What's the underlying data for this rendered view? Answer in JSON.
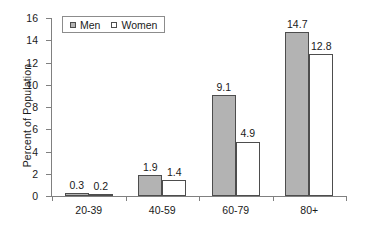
{
  "chart_data": {
    "type": "bar",
    "title": "",
    "xlabel": "",
    "ylabel": "Percent of Population",
    "categories": [
      "20-39",
      "40-59",
      "60-79",
      "80+"
    ],
    "series": [
      {
        "name": "Men",
        "swatch": "filled-gray-square",
        "color": "#b3b3b3",
        "values": [
          0.3,
          0.2999999,
          9.1,
          14.7
        ]
      },
      {
        "name": "Women",
        "swatch": "open-white-square",
        "color": "#ffffff",
        "values": [
          0.2,
          1.4,
          4.9,
          12.8
        ]
      }
    ],
    "series_corrected": [
      {
        "name": "Men",
        "values": [
          0.3,
          1.9,
          9.1,
          14.7
        ]
      },
      {
        "name": "Women",
        "values": [
          0.2,
          1.4,
          4.9,
          12.8
        ]
      }
    ],
    "data_labels": [
      [
        "0.3",
        "0.2"
      ],
      [
        "1.9",
        "1.4"
      ],
      [
        "9.1",
        "4.9"
      ],
      [
        "14.7",
        "12.8"
      ]
    ],
    "ylim": [
      0,
      16
    ],
    "yticks": [
      0,
      2,
      4,
      6,
      8,
      10,
      12,
      14,
      16
    ],
    "ytick_labels": [
      "0",
      "2",
      "4",
      "6",
      "8",
      "10",
      "12",
      "14",
      "16"
    ],
    "grid": false,
    "legend_position": "top-left-inside"
  },
  "legend": {
    "items": [
      {
        "label": "Men"
      },
      {
        "label": "Women"
      }
    ]
  }
}
